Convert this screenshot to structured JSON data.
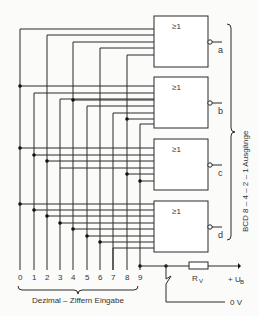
{
  "diagram": {
    "type": "decimal-to-BCD encoder circuit",
    "gates": [
      {
        "id": "a",
        "symbol": "≥1",
        "output": "a",
        "inputs": [
          "1",
          "3",
          "5",
          "7",
          "9"
        ]
      },
      {
        "id": "b",
        "symbol": "≥1",
        "output": "b",
        "inputs": [
          "2",
          "3",
          "6",
          "7"
        ]
      },
      {
        "id": "c",
        "symbol": "≥1",
        "output": "c",
        "inputs": [
          "4",
          "5",
          "6",
          "7"
        ]
      },
      {
        "id": "d",
        "symbol": "≥1",
        "output": "d",
        "inputs": [
          "8",
          "9"
        ]
      }
    ],
    "digit_labels": [
      "0",
      "1",
      "2",
      "3",
      "4",
      "5",
      "6",
      "7",
      "8",
      "9"
    ],
    "input_brace_label": "Dezimal – Ziffern Eingabe",
    "output_brace_label": "BCD 8 – 4 – 2 – 1 Ausgänge",
    "resistor_label": "R",
    "resistor_sub": "V",
    "supply_label": "+ U",
    "supply_sub": "B",
    "ground_label": "0 V"
  }
}
